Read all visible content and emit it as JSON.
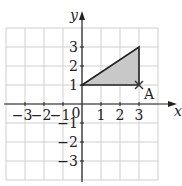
{
  "diagram": {
    "type": "coordinate-grid",
    "axes": {
      "x_label": "x",
      "y_label": "y",
      "origin_label": "0",
      "x_ticks": [
        "-3",
        "-2",
        "-1",
        "1",
        "2",
        "3"
      ],
      "x_tick_values": [
        -3,
        -2,
        -1,
        1,
        2,
        3
      ],
      "y_ticks": [
        "3",
        "2",
        "1",
        "-1",
        "-2",
        "-3"
      ],
      "y_tick_values": [
        3,
        2,
        1,
        -1,
        -2,
        -3
      ],
      "grid_range": {
        "xmin": -4,
        "xmax": 4,
        "ymin": -4,
        "ymax": 4
      }
    },
    "shape": {
      "name": "triangle",
      "vertices": [
        [
          0,
          1
        ],
        [
          3,
          3
        ],
        [
          3,
          1
        ]
      ],
      "fill": "#c8c8c8",
      "stroke": "#222222"
    },
    "point": {
      "label": "A",
      "x": 3,
      "y": 1,
      "marker": "cross"
    },
    "colors": {
      "grid": "#cfcfcf",
      "axis": "#222222"
    }
  }
}
